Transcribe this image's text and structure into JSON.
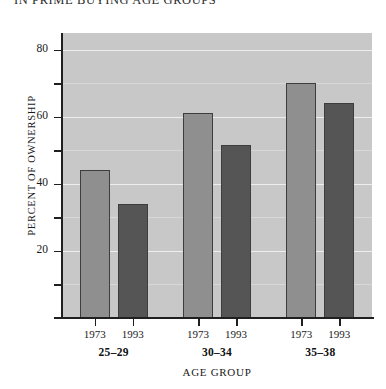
{
  "chart_data": {
    "type": "bar",
    "title": "IN PRIME BUYING AGE GROUPS",
    "xlabel": "Age Group",
    "ylabel": "Percent of ownership",
    "categories": [
      "25–29",
      "30–34",
      "35–38"
    ],
    "series": [
      {
        "name": "1973",
        "color": "#8f8f8f",
        "values": [
          44,
          61,
          70
        ]
      },
      {
        "name": "1993",
        "color": "#555555",
        "values": [
          34,
          51.5,
          64
        ]
      }
    ],
    "ylim": [
      0,
      85
    ],
    "y_ticks_major": [
      20,
      40,
      60,
      80
    ],
    "y_tick_labels": [
      "20",
      "40",
      "60",
      "80"
    ],
    "y_ticks_minor": [
      10,
      30,
      50,
      70
    ],
    "grid": true,
    "legend": "none",
    "plot_background": "#c8c8c8",
    "gridline_color": "#eeeeee",
    "axis_color": "#1f1f1f",
    "group_year_labels": [
      "1973",
      "1993"
    ]
  },
  "axes": {
    "y_title": "Percent of ownership",
    "x_title": "Age Group"
  }
}
